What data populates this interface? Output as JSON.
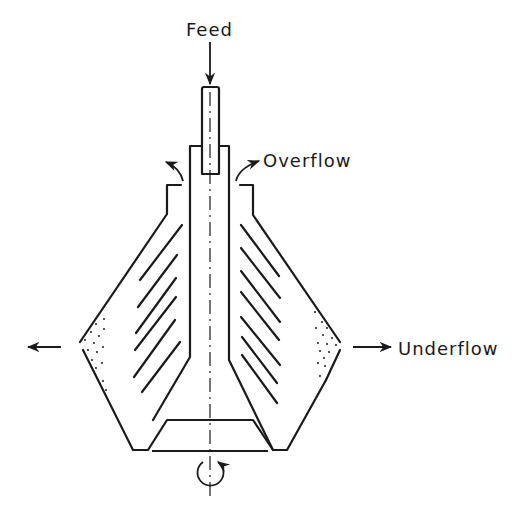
{
  "diagram": {
    "labels": {
      "feed": "Feed",
      "overflow": "Overflow",
      "underflow": "Underflow"
    },
    "components": [
      "feed-pipe",
      "central-tube",
      "conical-bowl",
      "disc-stack",
      "solids-discharge-nozzles",
      "bottom-distributor",
      "rotation-axis"
    ],
    "colors": {
      "ink": "#1a1a1a",
      "background": "#ffffff"
    }
  }
}
